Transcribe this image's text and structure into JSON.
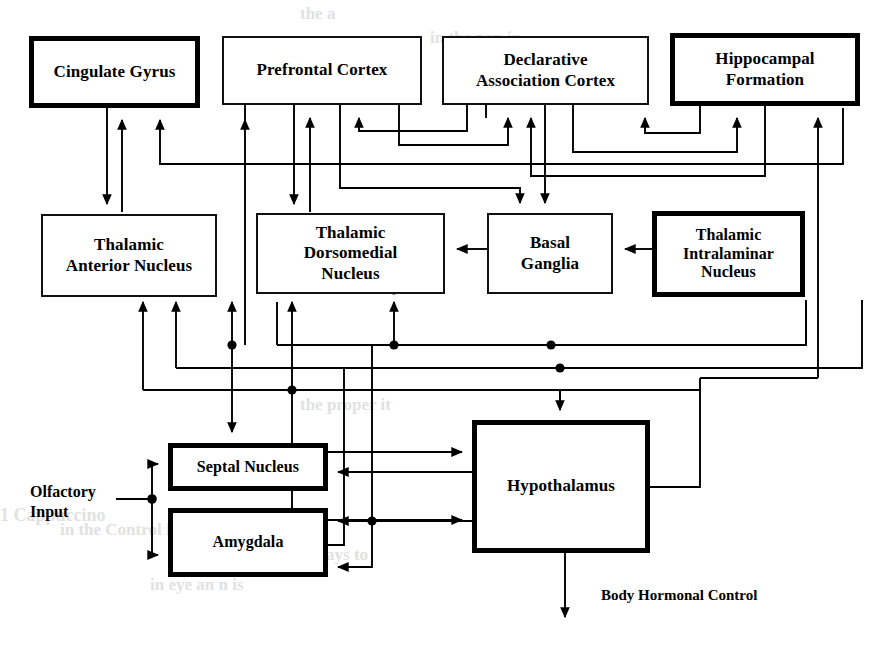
{
  "figure": {
    "kind": "block-diagram",
    "stroke_color": "#000000",
    "background_color": "#ffffff"
  },
  "nodes": [
    {
      "id": "cingulate_gyrus",
      "label": "Cingulate Gyrus",
      "lines": [
        "Cingulate Gyrus"
      ],
      "border": "thick",
      "x": 29,
      "y": 36,
      "w": 171,
      "h": 72,
      "font": 17
    },
    {
      "id": "prefrontal_cortex",
      "label": "Prefrontal Cortex",
      "lines": [
        "Prefrontal Cortex"
      ],
      "border": "thin",
      "x": 222,
      "y": 36,
      "w": 200,
      "h": 69,
      "font": 17
    },
    {
      "id": "declarative_cortex",
      "label": "Declarative Association Cortex",
      "lines": [
        "Declarative",
        "Association Cortex"
      ],
      "border": "thin",
      "x": 442,
      "y": 36,
      "w": 207,
      "h": 69,
      "font": 17
    },
    {
      "id": "hippocampal_formation",
      "label": "Hippocampal Formation",
      "lines": [
        "Hippocampal",
        "Formation"
      ],
      "border": "thick",
      "x": 670,
      "y": 33,
      "w": 190,
      "h": 73,
      "font": 17
    },
    {
      "id": "thalamic_anterior",
      "label": "Thalamic Anterior Nucleus",
      "lines": [
        "Thalamic",
        "Anterior Nucleus"
      ],
      "border": "thin",
      "x": 41,
      "y": 214,
      "w": 176,
      "h": 83,
      "font": 17
    },
    {
      "id": "thalamic_dorsomedial",
      "label": "Thalamic Dorsomedial Nucleus",
      "lines": [
        "Thalamic",
        "Dorsomedial",
        "Nucleus"
      ],
      "border": "thin",
      "x": 256,
      "y": 213,
      "w": 189,
      "h": 81,
      "font": 17
    },
    {
      "id": "basal_ganglia",
      "label": "Basal Ganglia",
      "lines": [
        "Basal",
        "Ganglia"
      ],
      "border": "thin",
      "x": 487,
      "y": 213,
      "w": 126,
      "h": 81,
      "font": 17
    },
    {
      "id": "thalamic_intralaminar",
      "label": "Thalamic Intralaminar Nucleus",
      "lines": [
        "Thalamic",
        "Intralaminar",
        "Nucleus"
      ],
      "border": "thick",
      "x": 652,
      "y": 211,
      "w": 153,
      "h": 86,
      "font": 16
    },
    {
      "id": "septal_nucleus",
      "label": "Septal Nucleus",
      "lines": [
        "Septal Nucleus"
      ],
      "border": "thick",
      "x": 168,
      "y": 443,
      "w": 160,
      "h": 48,
      "font": 16
    },
    {
      "id": "amygdala",
      "label": "Amygdala",
      "lines": [
        "Amygdala"
      ],
      "border": "thick",
      "x": 168,
      "y": 508,
      "w": 160,
      "h": 69,
      "font": 16
    },
    {
      "id": "hypothalamus",
      "label": "Hypothalamus",
      "lines": [
        "Hypothalamus"
      ],
      "border": "thick",
      "x": 472,
      "y": 420,
      "w": 178,
      "h": 133,
      "font": 17
    }
  ],
  "labels": [
    {
      "id": "olfactory_input",
      "lines": [
        "Olfactory",
        "Input"
      ],
      "x": 30,
      "y": 482,
      "font": 16,
      "align": "left"
    },
    {
      "id": "body_hormonal_control",
      "lines": [
        "Body Hormonal Control"
      ],
      "x": 601,
      "y": 586,
      "font": 15,
      "align": "left"
    }
  ],
  "background_text": [
    {
      "text": "the    a",
      "x": 300,
      "y": 4,
      "font": 17
    },
    {
      "text": "in the       non          in",
      "x": 430,
      "y": 28,
      "font": 17
    },
    {
      "text": "the             proper    it",
      "x": 300,
      "y": 395,
      "font": 17
    },
    {
      "text": "1 Cappuccino",
      "x": 0,
      "y": 505,
      "font": 18
    },
    {
      "text": "in the       Control      it    is",
      "x": 60,
      "y": 520,
      "font": 17
    },
    {
      "text": "in    the    to    ways    to",
      "x": 250,
      "y": 545,
      "font": 17
    },
    {
      "text": "in      eye    an   n       is",
      "x": 150,
      "y": 575,
      "font": 17
    }
  ],
  "edges": {
    "note": "directed connections drawn as orthogonal polylines with solid triangular arrowheads",
    "junction_dot_radius": 4.5,
    "list": [
      {
        "from": "thalamic_anterior",
        "to": "cingulate_gyrus"
      },
      {
        "from": "cingulate_gyrus",
        "to": "thalamic_anterior"
      },
      {
        "from": "hippocampal_formation",
        "to": "cingulate_gyrus"
      },
      {
        "from": "prefrontal_cortex",
        "to": "thalamic_dorsomedial"
      },
      {
        "from": "thalamic_dorsomedial",
        "to": "prefrontal_cortex"
      },
      {
        "from": "declarative_cortex",
        "to": "prefrontal_cortex"
      },
      {
        "from": "prefrontal_cortex",
        "to": "declarative_cortex"
      },
      {
        "from": "hippocampal_formation",
        "to": "declarative_cortex"
      },
      {
        "from": "declarative_cortex",
        "to": "hippocampal_formation"
      },
      {
        "from": "basal_ganglia",
        "to": "thalamic_dorsomedial"
      },
      {
        "from": "thalamic_intralaminar",
        "to": "basal_ganglia"
      },
      {
        "from": "prefrontal_cortex",
        "to": "basal_ganglia"
      },
      {
        "from": "declarative_cortex",
        "to": "basal_ganglia"
      },
      {
        "from": "septal_nucleus",
        "to": "hypothalamus"
      },
      {
        "from": "hypothalamus",
        "to": "septal_nucleus"
      },
      {
        "from": "amygdala",
        "to": "hypothalamus"
      },
      {
        "from": "hypothalamus",
        "to": "amygdala"
      },
      {
        "from": "septal_nucleus",
        "to": "thalamic_anterior"
      },
      {
        "from": "amygdala",
        "to": "thalamic_dorsomedial"
      },
      {
        "from": "hypothalamus",
        "to": "thalamic_anterior"
      },
      {
        "from": "hypothalamus",
        "to": "hippocampal_formation"
      },
      {
        "from": "thalamic_dorsomedial",
        "to": "septal_nucleus"
      },
      {
        "from": "hippocampal_formation",
        "to": "hypothalamus"
      },
      {
        "from": "olfactory_input",
        "to": "septal_nucleus"
      },
      {
        "from": "olfactory_input",
        "to": "amygdala"
      },
      {
        "from": "hypothalamus",
        "to": "body_hormonal_control"
      }
    ]
  }
}
